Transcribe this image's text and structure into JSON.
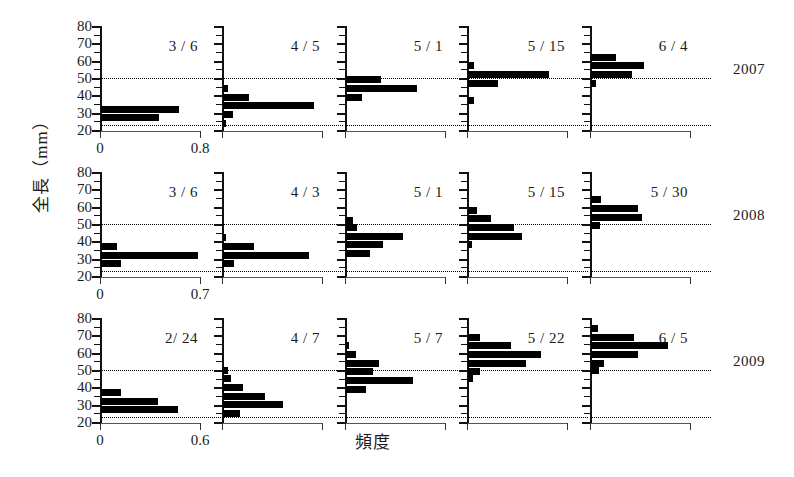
{
  "figure": {
    "xlabel": "頻度",
    "ylabel": "全長（mm）",
    "y_ticklabels": [
      "80",
      "70",
      "60",
      "50",
      "40",
      "30",
      "20"
    ],
    "reference_lines_mm": [
      50,
      23
    ],
    "years": [
      "2007",
      "2008",
      "2009"
    ]
  },
  "chart_data": {
    "type": "bar",
    "title": "",
    "xlabel": "頻度",
    "ylabel": "全長（mm）",
    "orientation": "horizontal",
    "ylim": [
      20,
      80
    ],
    "y_ticks_major": [
      20,
      30,
      40,
      50,
      60,
      70,
      80
    ],
    "y_ticks_minor_step": 5,
    "grid": false,
    "reference_lines": [
      50,
      23
    ],
    "legend": "none",
    "rows": [
      {
        "year": "2007",
        "xlim": [
          0,
          0.8
        ],
        "x_ticklabels": [
          "0",
          "0.8"
        ],
        "x_tickvalues": [
          0,
          0.8
        ],
        "panels": [
          {
            "label": "3 / 6",
            "bins": [
              32,
              27
            ],
            "values": [
              0.62,
              0.46
            ]
          },
          {
            "label": "4 / 5",
            "bins": [
              44,
              39,
              34,
              29,
              24
            ],
            "values": [
              0.04,
              0.21,
              0.73,
              0.08,
              0.02
            ]
          },
          {
            "label": "5 / 1",
            "bins": [
              49,
              44,
              39
            ],
            "values": [
              0.28,
              0.57,
              0.13
            ]
          },
          {
            "label": "5 / 15",
            "bins": [
              57,
              52,
              47,
              37
            ],
            "values": [
              0.05,
              0.65,
              0.24,
              0.05
            ]
          },
          {
            "label": "6 / 4",
            "bins": [
              62,
              57,
              52,
              47
            ],
            "values": [
              0.2,
              0.42,
              0.33,
              0.04
            ]
          }
        ]
      },
      {
        "year": "2008",
        "xlim": [
          0,
          0.7
        ],
        "x_ticklabels": [
          "0",
          "0.7"
        ],
        "x_tickvalues": [
          0,
          0.7
        ],
        "panels": [
          {
            "label": "3 / 6",
            "bins": [
              37,
              32,
              27
            ],
            "values": [
              0.11,
              0.68,
              0.14
            ]
          },
          {
            "label": "4 / 3",
            "bins": [
              42,
              37,
              32,
              27
            ],
            "values": [
              0.02,
              0.22,
              0.6,
              0.08
            ]
          },
          {
            "label": "5 / 1",
            "bins": [
              52,
              48,
              43,
              38,
              33
            ],
            "values": [
              0.05,
              0.08,
              0.4,
              0.26,
              0.17
            ]
          },
          {
            "label": "5 / 15",
            "bins": [
              58,
              53,
              48,
              43,
              38
            ],
            "values": [
              0.06,
              0.16,
              0.32,
              0.38,
              0.03
            ]
          },
          {
            "label": "5 / 30",
            "bins": [
              64,
              59,
              54,
              49
            ],
            "values": [
              0.07,
              0.33,
              0.36,
              0.06
            ]
          }
        ]
      },
      {
        "year": "2009",
        "xlim": [
          0,
          0.6
        ],
        "x_ticklabels": [
          "0",
          "0.6"
        ],
        "x_tickvalues": [
          0,
          0.6
        ],
        "panels": [
          {
            "label": "2/ 24",
            "bins": [
              37,
              32,
              27
            ],
            "values": [
              0.12,
              0.34,
              0.46
            ]
          },
          {
            "label": "4 / 7",
            "bins": [
              50,
              45,
              40,
              35,
              30,
              25
            ],
            "values": [
              0.03,
              0.05,
              0.12,
              0.25,
              0.36,
              0.1
            ]
          },
          {
            "label": "5 / 7",
            "bins": [
              64,
              59,
              54,
              49,
              44,
              39
            ],
            "values": [
              0.02,
              0.06,
              0.2,
              0.16,
              0.4,
              0.12
            ]
          },
          {
            "label": "5 / 22",
            "bins": [
              69,
              64,
              59,
              54,
              49,
              45
            ],
            "values": [
              0.07,
              0.26,
              0.44,
              0.35,
              0.07,
              0.03
            ]
          },
          {
            "label": "6 / 5",
            "bins": [
              74,
              69,
              64,
              59,
              54,
              50
            ],
            "values": [
              0.04,
              0.26,
              0.46,
              0.28,
              0.08,
              0.05
            ]
          }
        ]
      }
    ]
  }
}
